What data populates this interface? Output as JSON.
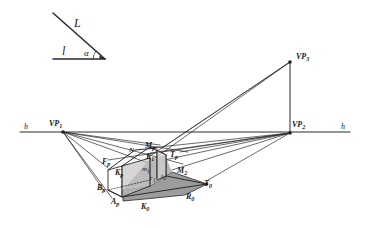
{
  "diagram": {
    "type": "perspective-construction",
    "light_direction": {
      "line_L_label": "L",
      "line_l_label": "l",
      "angle_label": "α"
    },
    "horizon": {
      "left_label": "h",
      "right_label": "h"
    },
    "vanishing_points": {
      "vp1": {
        "label": "VP",
        "sub": "1"
      },
      "vp2": {
        "label": "VP",
        "sub": "2"
      },
      "vp3": {
        "label": "VP",
        "sub": "3"
      }
    },
    "points": {
      "F": {
        "label": "F",
        "sub": "p"
      },
      "N": {
        "label": "N",
        "sub": ""
      },
      "M": {
        "label": "M",
        "sub": "p"
      },
      "K_top": {
        "label": "K",
        "sub": "p"
      },
      "K_inner": {
        "label": "K",
        "sub": "1"
      },
      "T_top": {
        "label": "T",
        "sub": "p"
      },
      "m": {
        "label": "m",
        "sub": "1"
      },
      "r": {
        "label": "r",
        "sub": "1"
      },
      "t": {
        "label": "t",
        "sub": "0"
      },
      "M2": {
        "label": "M",
        "sub": "2"
      },
      "T0": {
        "label": "T",
        "sub": "0"
      },
      "B": {
        "label": "B",
        "sub": "p"
      },
      "A": {
        "label": "A",
        "sub": "p"
      },
      "K0": {
        "label": "K",
        "sub": "0"
      },
      "R0": {
        "label": "R",
        "sub": "0"
      }
    },
    "colors": {
      "line": "#2a2a2a",
      "shadow_fill": "#a8a8a8",
      "shadow_fill_dark": "#8e8e8e",
      "face_fill": "#c4c4c4"
    }
  }
}
